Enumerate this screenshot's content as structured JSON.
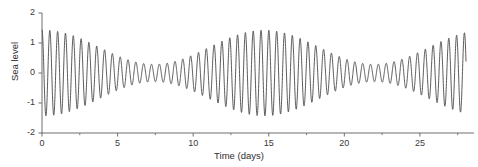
{
  "chart_data": {
    "type": "line",
    "title": "",
    "xlabel": "Time (days)",
    "ylabel": "Sea level",
    "xlim": [
      0,
      28
    ],
    "ylim": [
      -2,
      2
    ],
    "grid": false,
    "legend": null,
    "xticks": [
      0,
      5,
      10,
      15,
      20,
      25
    ],
    "xtick_labels": [
      "0",
      "5",
      "10",
      "15",
      "20",
      "25"
    ],
    "xminor_ticks": [
      2.5,
      7.5,
      12.5,
      17.5,
      22.5,
      27.5
    ],
    "yticks": [
      -2,
      -1,
      0,
      1,
      2
    ],
    "ytick_labels": [
      "-2",
      "-1",
      "0",
      "1",
      "2"
    ],
    "series": [
      {
        "name": "Sea level",
        "color": "#4a4a4a",
        "line_width": 0.9,
        "description": "Semidiurnal tidal oscillation with spring-neap envelope modulation",
        "model": {
          "carrier_period_days": 0.5175,
          "carrier_phase": 0.0,
          "envelope_mean": 0.86,
          "envelope_amplitude": 0.57,
          "envelope_period_days": 14.55,
          "envelope_phase_days": 0.15,
          "mean_level": 0.0,
          "t_start": 0.0,
          "t_end": 28.05,
          "samples": 3400
        },
        "notable_points": [
          {
            "t": 0.15,
            "value": 1.45,
            "note": "spring tide maximum"
          },
          {
            "t": 7.4,
            "value": 0.31,
            "note": "neap tide minimum"
          },
          {
            "t": 14.7,
            "value": 1.43,
            "note": "spring tide maximum"
          },
          {
            "t": 21.9,
            "value": 0.33,
            "note": "neap tide minimum"
          },
          {
            "t": 27.8,
            "value": 1.33,
            "note": "spring tide rising"
          }
        ]
      }
    ]
  },
  "axes": {
    "x_axis_color": "#6e6e6e",
    "y_axis_color": "#6e6e6e",
    "tick_color": "#6e6e6e"
  }
}
